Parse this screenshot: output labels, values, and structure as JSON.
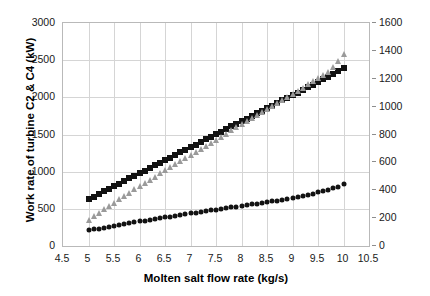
{
  "chart_data": {
    "type": "scatter",
    "title": "",
    "xlabel": "Molten salt flow rate (kg/s)",
    "ylabel": "Work rate of turbine C2 & C4 (kW)",
    "y2label": "Turbines input temperature (°C)",
    "xlim": [
      4.5,
      10.5
    ],
    "ylim": [
      0,
      3000
    ],
    "y2lim": [
      0,
      1600
    ],
    "grid": true,
    "legend": "none",
    "xticks": [
      "4.5",
      "5",
      "5.5",
      "6",
      "6.5",
      "7",
      "7.5",
      "8",
      "8.5",
      "9",
      "9.5",
      "10",
      "10.5"
    ],
    "xtick_values": [
      4.5,
      5,
      5.5,
      6,
      6.5,
      7,
      7.5,
      8,
      8.5,
      9,
      9.5,
      10,
      10.5
    ],
    "yticks": [
      "0",
      "500",
      "1000",
      "1500",
      "2000",
      "2500",
      "3000"
    ],
    "ytick_values": [
      0,
      500,
      1000,
      1500,
      2000,
      2500,
      3000
    ],
    "y2ticks": [
      "0",
      "200",
      "400",
      "600",
      "800",
      "1000",
      "1200",
      "1400",
      "1600"
    ],
    "y2tick_values": [
      0,
      200,
      400,
      600,
      800,
      1000,
      1200,
      1400,
      1600
    ],
    "x": [
      5.0,
      5.1,
      5.2,
      5.3,
      5.4,
      5.5,
      5.6,
      5.7,
      5.8,
      5.9,
      6.0,
      6.1,
      6.2,
      6.3,
      6.4,
      6.5,
      6.6,
      6.7,
      6.8,
      6.9,
      7.0,
      7.1,
      7.2,
      7.3,
      7.4,
      7.5,
      7.6,
      7.7,
      7.8,
      7.9,
      8.0,
      8.1,
      8.2,
      8.3,
      8.4,
      8.5,
      8.6,
      8.7,
      8.8,
      8.9,
      9.0,
      9.1,
      9.2,
      9.3,
      9.4,
      9.5,
      9.6,
      9.7,
      9.8,
      9.9,
      10.0
    ],
    "series": [
      {
        "name": "Work rate of turbine C2",
        "axis": "left",
        "marker": "square",
        "color": "#121212",
        "values": [
          630,
          665,
          700,
          735,
          770,
          805,
          840,
          875,
          910,
          945,
          980,
          1015,
          1050,
          1085,
          1120,
          1155,
          1190,
          1225,
          1260,
          1295,
          1330,
          1365,
          1400,
          1435,
          1470,
          1505,
          1540,
          1575,
          1610,
          1645,
          1680,
          1715,
          1750,
          1785,
          1820,
          1855,
          1890,
          1925,
          1960,
          1995,
          2030,
          2065,
          2100,
          2135,
          2170,
          2205,
          2240,
          2275,
          2310,
          2350,
          2390
        ]
      },
      {
        "name": "Turbines input temperature",
        "axis": "right",
        "marker": "triangle",
        "color": "#9a9a9a",
        "values": [
          190,
          215,
          240,
          264,
          288,
          312,
          336,
          360,
          383,
          406,
          429,
          452,
          475,
          498,
          521,
          543,
          565,
          587,
          609,
          631,
          653,
          675,
          697,
          719,
          741,
          763,
          785,
          807,
          829,
          851,
          873,
          895,
          917,
          939,
          961,
          983,
          1005,
          1027,
          1049,
          1071,
          1093,
          1115,
          1137,
          1159,
          1181,
          1203,
          1225,
          1250,
          1287,
          1330,
          1375
        ]
      },
      {
        "name": "Work rate of turbine C4",
        "axis": "left",
        "marker": "circle",
        "color": "#121212",
        "values": [
          210,
          222,
          234,
          246,
          258,
          270,
          282,
          294,
          306,
          318,
          330,
          341,
          352,
          363,
          374,
          385,
          396,
          407,
          418,
          429,
          440,
          450,
          460,
          470,
          480,
          490,
          500,
          510,
          520,
          530,
          540,
          550,
          560,
          570,
          580,
          590,
          600,
          612,
          624,
          636,
          648,
          660,
          675,
          690,
          705,
          720,
          738,
          756,
          775,
          800,
          830
        ]
      }
    ]
  }
}
